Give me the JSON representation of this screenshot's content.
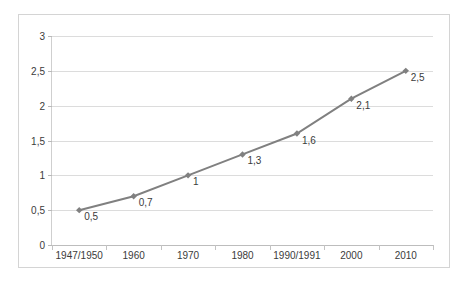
{
  "chart_data": {
    "type": "line",
    "title": "",
    "subtitle": "",
    "xlabel": "",
    "ylabel": "",
    "categories": [
      "1947/1950",
      "1960",
      "1970",
      "1980",
      "1990/1991",
      "2000",
      "2010"
    ],
    "values": [
      0.5,
      0.7,
      1.0,
      1.3,
      1.6,
      2.1,
      2.5
    ],
    "point_labels": [
      "0,5",
      "0,7",
      "1",
      "1,3",
      "1,6",
      "2,1",
      "2,5"
    ],
    "ylim": [
      0,
      3
    ],
    "ytick_values": [
      0,
      0.5,
      1,
      1.5,
      2,
      2.5,
      3
    ],
    "ytick_labels": [
      "0",
      "0,5",
      "1",
      "1,5",
      "2",
      "2,5",
      "3"
    ],
    "grid": true,
    "legend": false,
    "legend_position": "none",
    "series_color": "#808080",
    "gridline_color": "#dcdcdc",
    "axis_color": "#bdbdbd",
    "marker": "diamond",
    "decimal_separator": ","
  }
}
